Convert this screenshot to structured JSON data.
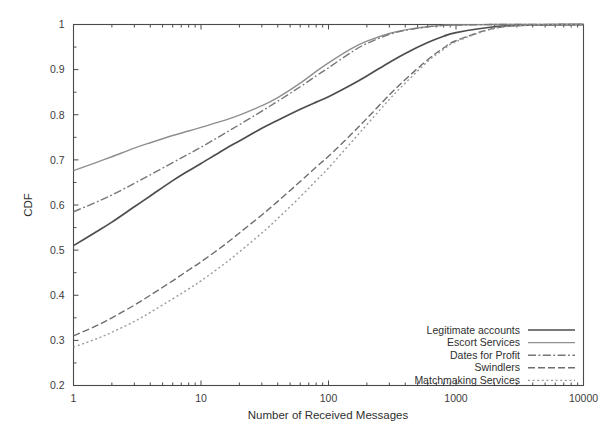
{
  "chart_data": {
    "type": "line",
    "title": "",
    "xlabel": "Number of Received Messages",
    "ylabel": "CDF",
    "xscale": "log",
    "xlim": [
      1,
      10000
    ],
    "ylim": [
      0.2,
      1.0
    ],
    "grid": false,
    "legend_position": "bottom-right",
    "xticks": [
      1,
      10,
      100,
      1000,
      10000
    ],
    "xtick_labels": [
      "1",
      "10",
      "100",
      "1000",
      "10000"
    ],
    "yticks": [
      0.2,
      0.3,
      0.4,
      0.5,
      0.6,
      0.7,
      0.8,
      0.9,
      1
    ],
    "ytick_labels": [
      "0.2",
      "0.3",
      "0.4",
      "0.5",
      "0.6",
      "0.7",
      "0.8",
      "0.9",
      "1"
    ],
    "x": [
      1,
      1.5,
      2,
      3,
      4,
      6,
      8,
      10,
      15,
      20,
      30,
      40,
      60,
      80,
      100,
      150,
      200,
      300,
      400,
      600,
      800,
      1000,
      2000,
      4000,
      10000
    ],
    "series": [
      {
        "name": "Legitimate accounts",
        "color": "#4d4d4d",
        "dash": "none",
        "width": 1.7,
        "values": [
          0.51,
          0.54,
          0.562,
          0.596,
          0.62,
          0.654,
          0.676,
          0.692,
          0.722,
          0.742,
          0.77,
          0.788,
          0.812,
          0.828,
          0.84,
          0.866,
          0.886,
          0.916,
          0.936,
          0.96,
          0.974,
          0.982,
          0.995,
          0.999,
          1.0
        ]
      },
      {
        "name": "Escort Services",
        "color": "#8f8f8f",
        "dash": "none",
        "width": 1.4,
        "values": [
          0.676,
          0.694,
          0.707,
          0.726,
          0.738,
          0.754,
          0.764,
          0.772,
          0.787,
          0.799,
          0.82,
          0.838,
          0.87,
          0.896,
          0.915,
          0.946,
          0.963,
          0.98,
          0.988,
          0.995,
          0.998,
          0.999,
          1.0,
          1.0,
          1.0
        ]
      },
      {
        "name": "Dates for Profit",
        "color": "#777777",
        "dash": "dashdot",
        "width": 1.4,
        "values": [
          0.585,
          0.606,
          0.622,
          0.648,
          0.667,
          0.694,
          0.713,
          0.728,
          0.757,
          0.778,
          0.808,
          0.83,
          0.862,
          0.886,
          0.904,
          0.938,
          0.958,
          0.978,
          0.987,
          0.995,
          0.998,
          0.999,
          1.0,
          1.0,
          1.0
        ]
      },
      {
        "name": "Swindlers",
        "color": "#6e6e6e",
        "dash": "dashed",
        "width": 1.4,
        "values": [
          0.31,
          0.332,
          0.35,
          0.378,
          0.4,
          0.432,
          0.456,
          0.474,
          0.51,
          0.538,
          0.578,
          0.608,
          0.652,
          0.684,
          0.708,
          0.756,
          0.792,
          0.844,
          0.878,
          0.922,
          0.948,
          0.964,
          0.992,
          0.999,
          1.0
        ]
      },
      {
        "name": "Matchmaking Services",
        "color": "#9a9a9a",
        "dash": "dotted",
        "width": 1.4,
        "values": [
          0.285,
          0.303,
          0.318,
          0.342,
          0.362,
          0.392,
          0.414,
          0.432,
          0.468,
          0.496,
          0.538,
          0.57,
          0.618,
          0.654,
          0.682,
          0.738,
          0.778,
          0.834,
          0.87,
          0.918,
          0.945,
          0.962,
          0.991,
          0.999,
          1.0
        ]
      }
    ]
  },
  "legend": {
    "items": [
      {
        "label": "Legitimate accounts"
      },
      {
        "label": "Escort Services"
      },
      {
        "label": "Dates for Profit"
      },
      {
        "label": "Swindlers"
      },
      {
        "label": "Matchmaking Services"
      }
    ]
  }
}
